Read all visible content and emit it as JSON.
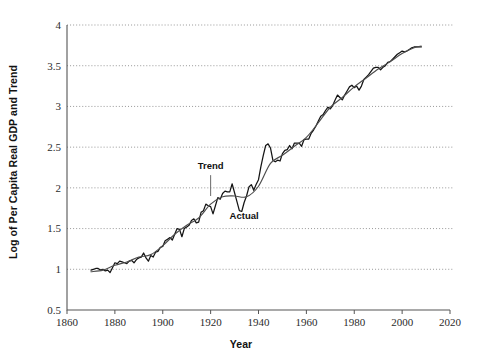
{
  "chart_data": {
    "type": "line",
    "title": "",
    "xlabel": "Year",
    "ylabel": "Log of Per Capita Real GDP and Trend",
    "xlim": [
      1860,
      2020
    ],
    "ylim": [
      0.5,
      4
    ],
    "xticks": [
      1860,
      1880,
      1900,
      1920,
      1940,
      1960,
      1980,
      2000,
      2020
    ],
    "yticks": [
      0.5,
      1,
      1.5,
      2,
      2.5,
      3,
      3.5,
      4
    ],
    "xtick_labels": [
      "1860",
      "1880",
      "1900",
      "1920",
      "1940",
      "1960",
      "1980",
      "2000",
      "2020"
    ],
    "ytick_labels": [
      "0.5",
      "1",
      "1.5",
      "2",
      "2.5",
      "3",
      "3.5",
      "4"
    ],
    "grid": "horizontal-dotted",
    "legend_position": "inline-annotations",
    "annotations": [
      {
        "label": "Trend",
        "x": 1920,
        "y": 2.23,
        "points_to_x": 1920,
        "points_to_y": 1.9
      },
      {
        "label": "Actual",
        "x": 1934,
        "y": 1.62
      }
    ],
    "series": [
      {
        "name": "Actual",
        "color": "#141414",
        "x": [
          1870,
          1871,
          1872,
          1873,
          1874,
          1875,
          1876,
          1877,
          1878,
          1879,
          1880,
          1881,
          1882,
          1883,
          1884,
          1885,
          1886,
          1887,
          1888,
          1889,
          1890,
          1891,
          1892,
          1893,
          1894,
          1895,
          1896,
          1897,
          1898,
          1899,
          1900,
          1901,
          1902,
          1903,
          1904,
          1905,
          1906,
          1907,
          1908,
          1909,
          1910,
          1911,
          1912,
          1913,
          1914,
          1915,
          1916,
          1917,
          1918,
          1919,
          1920,
          1921,
          1922,
          1923,
          1924,
          1925,
          1926,
          1927,
          1928,
          1929,
          1930,
          1931,
          1932,
          1933,
          1934,
          1935,
          1936,
          1937,
          1938,
          1939,
          1940,
          1941,
          1942,
          1943,
          1944,
          1945,
          1946,
          1947,
          1948,
          1949,
          1950,
          1951,
          1952,
          1953,
          1954,
          1955,
          1956,
          1957,
          1958,
          1959,
          1960,
          1961,
          1962,
          1963,
          1964,
          1965,
          1966,
          1967,
          1968,
          1969,
          1970,
          1971,
          1972,
          1973,
          1974,
          1975,
          1976,
          1977,
          1978,
          1979,
          1980,
          1981,
          1982,
          1983,
          1984,
          1985,
          1986,
          1987,
          1988,
          1989,
          1990,
          1991,
          1992,
          1993,
          1994,
          1995,
          1996,
          1997,
          1998,
          1999,
          2000,
          2001,
          2002,
          2003,
          2004,
          2005,
          2006,
          2007,
          2008
        ],
        "y": [
          0.99,
          1.0,
          1.01,
          1.01,
          0.99,
          1.0,
          0.98,
          0.99,
          0.96,
          1.02,
          1.08,
          1.07,
          1.1,
          1.09,
          1.08,
          1.07,
          1.1,
          1.11,
          1.08,
          1.12,
          1.14,
          1.15,
          1.2,
          1.14,
          1.1,
          1.17,
          1.15,
          1.21,
          1.22,
          1.27,
          1.28,
          1.35,
          1.37,
          1.39,
          1.36,
          1.43,
          1.5,
          1.49,
          1.4,
          1.5,
          1.52,
          1.54,
          1.6,
          1.62,
          1.57,
          1.58,
          1.7,
          1.72,
          1.8,
          1.78,
          1.77,
          1.68,
          1.78,
          1.88,
          1.86,
          1.93,
          1.96,
          1.95,
          1.95,
          2.05,
          1.94,
          1.83,
          1.72,
          1.71,
          1.82,
          1.9,
          2.01,
          2.04,
          1.97,
          2.04,
          2.1,
          2.26,
          2.4,
          2.52,
          2.54,
          2.49,
          2.34,
          2.32,
          2.34,
          2.33,
          2.42,
          2.46,
          2.47,
          2.52,
          2.48,
          2.55,
          2.55,
          2.55,
          2.51,
          2.59,
          2.6,
          2.6,
          2.67,
          2.71,
          2.76,
          2.82,
          2.88,
          2.9,
          2.95,
          2.99,
          2.97,
          3.01,
          3.08,
          3.14,
          3.11,
          3.08,
          3.14,
          3.19,
          3.24,
          3.26,
          3.23,
          3.25,
          3.2,
          3.25,
          3.33,
          3.36,
          3.39,
          3.43,
          3.47,
          3.48,
          3.48,
          3.45,
          3.48,
          3.5,
          3.54,
          3.55,
          3.58,
          3.61,
          3.64,
          3.66,
          3.68,
          3.67,
          3.68,
          3.7,
          3.72,
          3.73,
          3.73,
          3.73,
          3.73
        ]
      },
      {
        "name": "Trend",
        "color": "#4e4e4e",
        "x": [
          1870,
          1875,
          1880,
          1885,
          1890,
          1895,
          1900,
          1905,
          1910,
          1915,
          1920,
          1925,
          1930,
          1935,
          1940,
          1945,
          1950,
          1955,
          1960,
          1965,
          1970,
          1975,
          1980,
          1985,
          1990,
          1995,
          2000,
          2005,
          2008
        ],
        "y": [
          0.97,
          0.99,
          1.05,
          1.09,
          1.15,
          1.18,
          1.29,
          1.43,
          1.54,
          1.63,
          1.8,
          1.89,
          1.9,
          1.89,
          2.02,
          2.3,
          2.4,
          2.51,
          2.62,
          2.8,
          2.99,
          3.11,
          3.24,
          3.35,
          3.46,
          3.55,
          3.65,
          3.72,
          3.74
        ]
      }
    ]
  }
}
